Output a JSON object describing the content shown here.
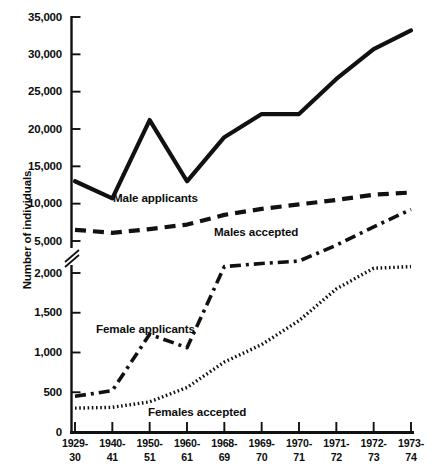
{
  "chart_data": {
    "type": "line",
    "title": "",
    "xlabel": "",
    "ylabel": "Number of individuals",
    "grid": false,
    "legend_position": "inline-labels",
    "axis_break": true,
    "axis_break_note": "y-axis broken between 5,000 and 2,000",
    "categories": [
      "1929-30",
      "1940-41",
      "1950-51",
      "1960-61",
      "1968-69",
      "1969-70",
      "1970-71",
      "1971-72",
      "1972-73",
      "1973-74"
    ],
    "category_lines": [
      [
        "1929-",
        "30"
      ],
      [
        "1940-",
        "41"
      ],
      [
        "1950-",
        "51"
      ],
      [
        "1960-",
        "61"
      ],
      [
        "1968-",
        "69"
      ],
      [
        "1969-",
        "70"
      ],
      [
        "1970-",
        "71"
      ],
      [
        "1971-",
        "72"
      ],
      [
        "1972-",
        "73"
      ],
      [
        "1973-",
        "74"
      ]
    ],
    "upper_yticks": [
      5000,
      10000,
      15000,
      20000,
      25000,
      30000,
      35000
    ],
    "upper_ytick_labels": [
      "5,000",
      "10,000",
      "15,000",
      "20,000",
      "25,000",
      "30,000",
      "35,000"
    ],
    "lower_yticks": [
      0,
      500,
      1000,
      1500,
      2000
    ],
    "lower_ytick_labels": [
      "0",
      "500",
      "1,000",
      "1,500",
      "2,000"
    ],
    "upper_ylim": [
      5000,
      35000
    ],
    "lower_ylim": [
      0,
      2000
    ],
    "series": [
      {
        "name": "Male applicants",
        "style": "solid",
        "scale": "upper",
        "values": [
          13000,
          10700,
          21200,
          13000,
          18900,
          22000,
          22000,
          26700,
          30700,
          33200
        ]
      },
      {
        "name": "Males accepted",
        "style": "dashed",
        "scale": "upper",
        "values": [
          6500,
          6100,
          6600,
          7200,
          8500,
          9300,
          9900,
          10500,
          11200,
          11500
        ]
      },
      {
        "name": "Female applicants",
        "style": "dash-dot",
        "scale": "lower",
        "values": [
          450,
          520,
          1230,
          1060,
          2080,
          2120,
          2150,
          2350,
          2580,
          2800
        ]
      },
      {
        "name": "Females accepted",
        "style": "dotted",
        "scale": "lower",
        "values": [
          300,
          310,
          380,
          560,
          880,
          1100,
          1400,
          1800,
          2060,
          2080
        ]
      }
    ],
    "series_labels": [
      {
        "text": "Male applicants",
        "x": 113,
        "y": 191
      },
      {
        "text": "Males accepted",
        "x": 214,
        "y": 225
      },
      {
        "text": "Female applicants",
        "x": 96,
        "y": 322
      },
      {
        "text": "Females accepted",
        "x": 148,
        "y": 405
      }
    ],
    "ink_color": "#111111",
    "background_color": "#ffffff"
  }
}
